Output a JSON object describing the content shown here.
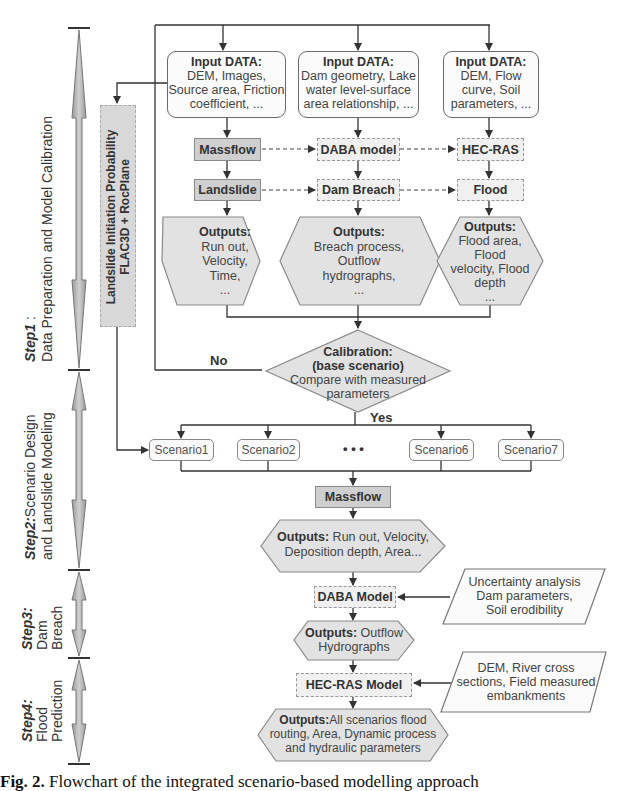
{
  "steps": [
    {
      "id": "step1",
      "title": "Step1",
      "suffix": " :",
      "desc": "Data Preparation and Model Calibration"
    },
    {
      "id": "step2",
      "title": "Step2:",
      "desc_line1": "Scenario Design",
      "desc_line2": "and Landslide Modeling"
    },
    {
      "id": "step3",
      "title": "Step3:",
      "desc_line1": "Dam",
      "desc_line2": "Breach"
    },
    {
      "id": "step4",
      "title": "Step4:",
      "desc_line1": "Flood",
      "desc_line2": "Prediction"
    }
  ],
  "side_box": {
    "line1": "Landslide Initiation Probability",
    "line2": "FLAC3D + RocPlane"
  },
  "inputs": [
    {
      "header": "Input DATA:",
      "lines": [
        "DEM, Images,",
        "Source area, Friction",
        "coefficient, ..."
      ]
    },
    {
      "header": "Input DATA:",
      "lines": [
        "Dam geometry, Lake",
        "water level-surface",
        "area relationship, ..."
      ]
    },
    {
      "header": "Input DATA:",
      "lines": [
        "DEM, Flow",
        "curve, Soil",
        "parameters, ..."
      ]
    }
  ],
  "models": [
    "Massflow",
    "DABA model",
    "HEC-RAS"
  ],
  "processes": [
    "Landslide",
    "Dam Breach",
    "Flood"
  ],
  "outputs": [
    {
      "header": "Outputs:",
      "lines": [
        "Run out,",
        "Velocity,",
        "Time,",
        "..."
      ]
    },
    {
      "header": "Outputs:",
      "lines": [
        "Breach process,",
        "Outflow",
        "hydrographs,",
        "..."
      ]
    },
    {
      "header": "Outputs:",
      "lines": [
        "Flood area,",
        "Flood",
        "velocity, Flood",
        "depth",
        "..."
      ]
    }
  ],
  "calibration": {
    "line1": "Calibration:",
    "line2": "(base scenario)",
    "line3": "Compare with  measured",
    "line4": "parameters"
  },
  "branch_labels": {
    "no": "No",
    "yes": "Yes"
  },
  "scenarios": [
    "Scenario1",
    "Scenario2",
    "Scenario6",
    "Scenario7"
  ],
  "ellipsis": "• • •",
  "step2_model": "Massflow",
  "step2_output": {
    "header": "Outputs:",
    "line1": " Run out, Velocity,",
    "line2": "Deposition depth, Area..."
  },
  "step3_model": "DABA Model",
  "step3_input": {
    "lines": [
      "Uncertainty analysis",
      "Dam parameters,",
      "Soil erodibility"
    ]
  },
  "step3_output": {
    "header": "Outputs:",
    "line1": " Outflow",
    "line2": "Hydrographs"
  },
  "step4_model": "HEC-RAS  Model",
  "step4_input": {
    "lines": [
      "DEM, River cross",
      "sections, Field measured",
      "embankments"
    ]
  },
  "step4_output": {
    "header": "Outputs:",
    "line1": "All scenarios flood",
    "line2": "routing, Area, Dynamic process",
    "line3": "and hydraulic parameters"
  },
  "caption": {
    "label": "Fig. 2.",
    "text": " Flowchart of the integrated scenario-based modelling approach"
  }
}
